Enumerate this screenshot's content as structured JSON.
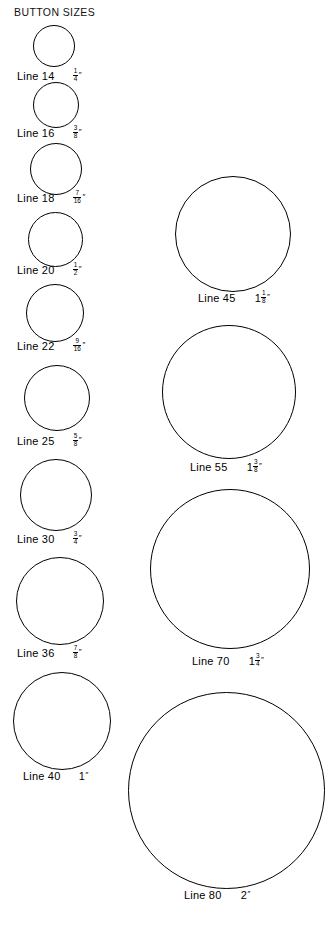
{
  "page": {
    "title": "BUTTON SIZES",
    "width": 335,
    "height": 928,
    "background": "#ffffff",
    "stroke_color": "#000000"
  },
  "columns": {
    "left": {
      "name": "small-sizes-column",
      "items": [
        {
          "line": "Line 14",
          "size_text": "1/4\"",
          "whole": "",
          "numerator": "1",
          "denominator": "4",
          "inch_symbol": "″",
          "diameter_px": 42,
          "circle": {
            "left": 33,
            "top": 25,
            "size": 42
          },
          "label": {
            "left": 17,
            "top": 68,
            "size_left": 61
          }
        },
        {
          "line": "Line 16",
          "size_text": "3/8\"",
          "whole": "",
          "numerator": "3",
          "denominator": "8",
          "inch_symbol": "″",
          "diameter_px": 46,
          "circle": {
            "left": 33,
            "top": 82,
            "size": 46
          },
          "label": {
            "left": 17,
            "top": 125,
            "size_left": 61
          }
        },
        {
          "line": "Line 18",
          "size_text": "7/16\"",
          "whole": "",
          "numerator": "7",
          "denominator": "16",
          "inch_symbol": "″",
          "diameter_px": 52,
          "circle": {
            "left": 30,
            "top": 143,
            "size": 52
          },
          "label": {
            "left": 17,
            "top": 190,
            "size_left": 61
          }
        },
        {
          "line": "Line 20",
          "size_text": "1/2\"",
          "whole": "",
          "numerator": "1",
          "denominator": "2",
          "inch_symbol": "″",
          "diameter_px": 55,
          "circle": {
            "left": 28,
            "top": 212,
            "size": 55
          },
          "label": {
            "left": 17,
            "top": 262,
            "size_left": 61
          }
        },
        {
          "line": "Line 22",
          "size_text": "9/16\"",
          "whole": "",
          "numerator": "9",
          "denominator": "16",
          "inch_symbol": "″",
          "diameter_px": 58,
          "circle": {
            "left": 26,
            "top": 284,
            "size": 58
          },
          "label": {
            "left": 17,
            "top": 338,
            "size_left": 61
          }
        },
        {
          "line": "Line 25",
          "size_text": "5/8\"",
          "whole": "",
          "numerator": "5",
          "denominator": "8",
          "inch_symbol": "″",
          "diameter_px": 66,
          "circle": {
            "left": 24,
            "top": 365,
            "size": 66
          },
          "label": {
            "left": 17,
            "top": 433,
            "size_left": 61
          }
        },
        {
          "line": "Line 30",
          "size_text": "3/4\"",
          "whole": "",
          "numerator": "3",
          "denominator": "4",
          "inch_symbol": "″",
          "diameter_px": 72,
          "circle": {
            "left": 20,
            "top": 459,
            "size": 72
          },
          "label": {
            "left": 17,
            "top": 531,
            "size_left": 61
          }
        },
        {
          "line": "Line 36",
          "size_text": "7/8\"",
          "whole": "",
          "numerator": "7",
          "denominator": "8",
          "inch_symbol": "″",
          "diameter_px": 88,
          "circle": {
            "left": 16,
            "top": 557,
            "size": 88
          },
          "label": {
            "left": 17,
            "top": 645,
            "size_left": 61
          }
        },
        {
          "line": "Line 40",
          "size_text": "1\"",
          "whole": "1",
          "numerator": "",
          "denominator": "",
          "inch_symbol": "″",
          "diameter_px": 98,
          "circle": {
            "left": 13,
            "top": 672,
            "size": 98
          },
          "label": {
            "left": 23,
            "top": 771,
            "size_left": 61
          }
        }
      ]
    },
    "right": {
      "name": "large-sizes-column",
      "items": [
        {
          "line": "Line 45",
          "size_text": "1 1/8\"",
          "whole": "1",
          "numerator": "1",
          "denominator": "8",
          "inch_symbol": "″",
          "diameter_px": 116,
          "circle": {
            "left": 175,
            "top": 176,
            "size": 116
          },
          "label": {
            "left": 198,
            "top": 290,
            "size_left": 62
          }
        },
        {
          "line": "Line 55",
          "size_text": "1 3/8\"",
          "whole": "1",
          "numerator": "3",
          "denominator": "8",
          "inch_symbol": "″",
          "diameter_px": 134,
          "circle": {
            "left": 162,
            "top": 325,
            "size": 134
          },
          "label": {
            "left": 190,
            "top": 459,
            "size_left": 62
          }
        },
        {
          "line": "Line 70",
          "size_text": "1 3/4\"",
          "whole": "1",
          "numerator": "3",
          "denominator": "4",
          "inch_symbol": "″",
          "diameter_px": 160,
          "circle": {
            "left": 150,
            "top": 489,
            "size": 160
          },
          "label": {
            "left": 192,
            "top": 653,
            "size_left": 62
          }
        },
        {
          "line": "Line 80",
          "size_text": "2\"",
          "whole": "2",
          "numerator": "",
          "denominator": "",
          "inch_symbol": "″",
          "diameter_px": 197,
          "circle": {
            "left": 128,
            "top": 692,
            "size": 197
          },
          "label": {
            "left": 184,
            "top": 890,
            "size_left": 62
          }
        }
      ]
    }
  }
}
